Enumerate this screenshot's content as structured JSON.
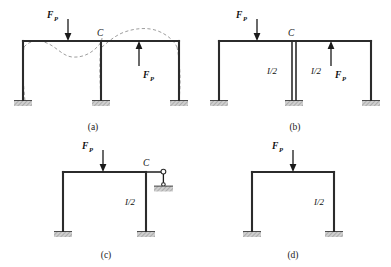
{
  "figure": {
    "background_color": "#ffffff",
    "member_color": "#2b2b2b",
    "deflection_color": "#8d8d8d",
    "support_fill_color": "#c9c9c9",
    "panels": [
      {
        "id": "a",
        "caption": "(a)",
        "description": "Two-bay single-storey frame with three fixed supports, downward load at left bay midspan and upward load at right bay midspan, dashed deflected shape shown",
        "node_labels": [
          "C"
        ],
        "load_labels": [
          {
            "symbol": "F",
            "subscript": "P",
            "direction": "down"
          },
          {
            "symbol": "F",
            "subscript": "P",
            "direction": "up"
          }
        ],
        "inertia_labels": [],
        "supports": [
          "fixed",
          "fixed",
          "fixed"
        ],
        "deflection_shown": true
      },
      {
        "id": "b",
        "caption": "(b)",
        "description": "Same two-bay frame with centre column split into two halves each of moment of inertia I/2",
        "node_labels": [
          "C"
        ],
        "load_labels": [
          {
            "symbol": "F",
            "subscript": "P",
            "direction": "down"
          },
          {
            "symbol": "F",
            "subscript": "P",
            "direction": "up"
          }
        ],
        "inertia_labels": [
          "I/2",
          "I/2"
        ],
        "supports": [
          "fixed",
          "fixed",
          "fixed"
        ],
        "deflection_shown": false
      },
      {
        "id": "c",
        "caption": "(c)",
        "description": "Half frame: left bay retained, centre column of inertia I/2 with fixed base, node C restrained by a vertical link support",
        "node_labels": [
          "C"
        ],
        "load_labels": [
          {
            "symbol": "F",
            "subscript": "P",
            "direction": "down"
          }
        ],
        "inertia_labels": [
          "I/2"
        ],
        "supports": [
          "fixed",
          "fixed",
          "link"
        ],
        "deflection_shown": false
      },
      {
        "id": "d",
        "caption": "(d)",
        "description": "Single-bay portal frame with right column of inertia I/2, downward load at beam midspan, two fixed supports",
        "node_labels": [],
        "load_labels": [
          {
            "symbol": "F",
            "subscript": "P",
            "direction": "down"
          }
        ],
        "inertia_labels": [
          "I/2"
        ],
        "supports": [
          "fixed",
          "fixed"
        ],
        "deflection_shown": false
      }
    ]
  }
}
